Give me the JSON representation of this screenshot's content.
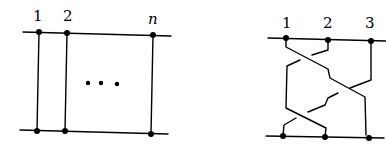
{
  "left_diagram": {
    "labels": [
      "1",
      "2",
      "n"
    ],
    "ellipsis": "…",
    "description": "n parallel vertical strands connecting two horizontal lines (trivial braid)"
  },
  "right_diagram": {
    "labels": [
      "1",
      "2",
      "3"
    ],
    "description": "3-strand braid with crossings between two horizontal lines"
  },
  "colors": {
    "stroke": "#000000",
    "background": "#ffffff"
  }
}
